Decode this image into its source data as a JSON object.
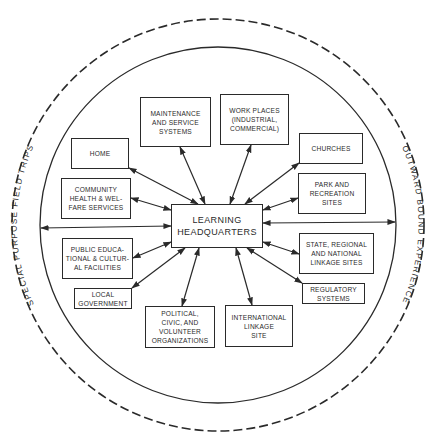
{
  "diagram": {
    "center": {
      "label": "LEARNING\nHEADQUARTERS",
      "box": [
        171,
        204,
        92,
        44
      ]
    },
    "outer_ring": {
      "left_label": "SPECIAL PURPOSE FIELD TRIPS",
      "right_label": "OUTWARD BOUND EXPERIENCE",
      "style": "dashed"
    },
    "inner_ring": {
      "style": "solid"
    },
    "nodes": [
      {
        "id": "home",
        "label": "HOME",
        "box": [
          71,
          138,
          58,
          31
        ]
      },
      {
        "id": "maintenance",
        "label": "MAINTENANCE\nAND SERVICE\nSYSTEMS",
        "box": [
          140,
          97,
          71,
          50
        ]
      },
      {
        "id": "workplaces",
        "label": "WORK PLACES\n(INDUSTRIAL,\nCOMMERCIAL)",
        "box": [
          220,
          94,
          69,
          51
        ]
      },
      {
        "id": "churches",
        "label": "CHURCHES",
        "box": [
          299,
          133,
          64,
          31
        ]
      },
      {
        "id": "park",
        "label": "PARK AND\nRECREATION\nSITES",
        "box": [
          298,
          173,
          68,
          41
        ]
      },
      {
        "id": "community",
        "label": "COMMUNITY\nHEALTH & WEL-\nFARE SERVICES",
        "box": [
          61,
          178,
          70,
          41
        ]
      },
      {
        "id": "public",
        "label": "PUBLIC EDUCA-\nTIONAL & CULTUR-\nAL FACILITIES",
        "box": [
          62,
          238,
          71,
          41
        ]
      },
      {
        "id": "localgov",
        "label": "LOCAL\nGOVERNMENT",
        "box": [
          74,
          288,
          58,
          21
        ]
      },
      {
        "id": "political",
        "label": "POLITICAL,\nCIVIC, AND\nVOLUNTEER\nORGANIZATIONS",
        "box": [
          145,
          306,
          70,
          42
        ]
      },
      {
        "id": "international",
        "label": "INTERNATIONAL\nLINKAGE\nSITE",
        "box": [
          225,
          305,
          68,
          42
        ]
      },
      {
        "id": "state",
        "label": "STATE, REGIONAL\nAND NATIONAL\nLINKAGE SITES",
        "box": [
          299,
          233,
          75,
          41
        ]
      },
      {
        "id": "regulatory",
        "label": "REGULATORY\nSYSTEMS",
        "box": [
          302,
          283,
          63,
          21
        ]
      }
    ],
    "connections": [
      {
        "to": "home",
        "from_pt": [
          198,
          204
        ],
        "to_pt": [
          129,
          168
        ]
      },
      {
        "to": "maintenance",
        "from_pt": [
          205,
          204
        ],
        "to_pt": [
          180,
          147
        ]
      },
      {
        "to": "workplaces",
        "from_pt": [
          230,
          204
        ],
        "to_pt": [
          251,
          145
        ]
      },
      {
        "to": "churches",
        "from_pt": [
          245,
          204
        ],
        "to_pt": [
          299,
          163
        ]
      },
      {
        "to": "park",
        "from_pt": [
          263,
          210
        ],
        "to_pt": [
          298,
          198
        ]
      },
      {
        "to": "community",
        "from_pt": [
          171,
          210
        ],
        "to_pt": [
          131,
          198
        ]
      },
      {
        "to": "public",
        "from_pt": [
          171,
          242
        ],
        "to_pt": [
          133,
          258
        ]
      },
      {
        "to": "localgov",
        "from_pt": [
          185,
          248
        ],
        "to_pt": [
          132,
          288
        ]
      },
      {
        "to": "political",
        "from_pt": [
          199,
          248
        ],
        "to_pt": [
          182,
          306
        ]
      },
      {
        "to": "international",
        "from_pt": [
          236,
          248
        ],
        "to_pt": [
          252,
          305
        ]
      },
      {
        "to": "state",
        "from_pt": [
          263,
          242
        ],
        "to_pt": [
          299,
          254
        ]
      },
      {
        "to": "regulatory",
        "from_pt": [
          247,
          248
        ],
        "to_pt": [
          302,
          283
        ]
      },
      {
        "to": "outer-left",
        "from_pt": [
          171,
          226
        ],
        "to_pt": [
          41,
          228
        ]
      },
      {
        "to": "outer-right",
        "from_pt": [
          263,
          223
        ],
        "to_pt": [
          395,
          222
        ]
      }
    ],
    "colors": {
      "ink": "#2a2a2a",
      "background": "#ffffff"
    }
  }
}
